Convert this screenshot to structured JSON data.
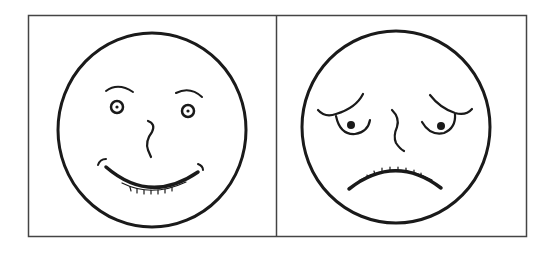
{
  "figure": {
    "panels": [
      {
        "id": "left",
        "expression": "happy",
        "label": ""
      },
      {
        "id": "right",
        "expression": "sad",
        "label": ""
      }
    ],
    "colors": {
      "line": "#1a1a1a",
      "border": "#444444",
      "background": "#ffffff"
    }
  }
}
